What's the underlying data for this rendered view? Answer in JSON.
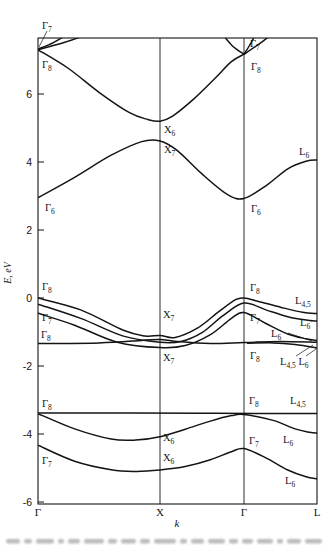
{
  "figure": {
    "background": "#ffffff",
    "line_color": "#141414",
    "cropped_caption_visible": true
  },
  "chart_data": {
    "type": "line",
    "title": "",
    "xlabel": "k",
    "ylabel": "E, eV",
    "legend": "none",
    "grid": "vertical-lines-at-high-symmetry-points",
    "k_points": [
      "Γ",
      "X",
      "Γ",
      "L"
    ],
    "axis": {
      "x_anchors_px": [
        38,
        160,
        244,
        317
      ],
      "y0_px": 298,
      "px_per_ev": 34,
      "top_px": 38,
      "bottom_px": 504,
      "left_px": 38,
      "right_px": 317,
      "y_ticks": [
        6,
        4,
        2,
        0,
        -2,
        -4,
        -6
      ],
      "ylim": [
        -6.1,
        7.65
      ]
    },
    "bands": [
      {
        "name": "conduction-upper",
        "points": [
          [
            0,
            7.3
          ],
          [
            0.25,
            6.75
          ],
          [
            0.5,
            6.05
          ],
          [
            0.75,
            5.45
          ],
          [
            0.9,
            5.25
          ],
          [
            1,
            5.2
          ],
          [
            1.15,
            5.35
          ],
          [
            1.4,
            5.85
          ],
          [
            1.65,
            6.45
          ],
          [
            1.85,
            6.95
          ],
          [
            2,
            7.17
          ]
        ]
      },
      {
        "name": "gamma1-arm-steep",
        "points": [
          [
            0,
            7.32
          ],
          [
            0.13,
            7.52
          ],
          [
            0.26,
            7.8
          ]
        ]
      },
      {
        "name": "gamma1-arm-wide",
        "points": [
          [
            0,
            7.3
          ],
          [
            0.22,
            7.52
          ],
          [
            0.43,
            7.78
          ]
        ]
      },
      {
        "name": "gamma2-arm-left",
        "points": [
          [
            1.73,
            7.8
          ],
          [
            1.86,
            7.42
          ],
          [
            2,
            7.17
          ]
        ]
      },
      {
        "name": "gamma2-arm-right-steep",
        "points": [
          [
            2,
            7.17
          ],
          [
            2.08,
            7.44
          ],
          [
            2.17,
            7.8
          ]
        ]
      },
      {
        "name": "gamma2-arm-right-wide",
        "points": [
          [
            2,
            7.17
          ],
          [
            2.2,
            7.46
          ],
          [
            2.41,
            7.8
          ]
        ]
      },
      {
        "name": "conduction-lower",
        "points": [
          [
            0,
            2.95
          ],
          [
            0.3,
            3.55
          ],
          [
            0.6,
            4.2
          ],
          [
            0.85,
            4.6
          ],
          [
            1,
            4.62
          ],
          [
            1.2,
            4.35
          ],
          [
            1.5,
            3.65
          ],
          [
            1.8,
            3.05
          ],
          [
            2,
            2.93
          ],
          [
            2.3,
            3.3
          ],
          [
            2.6,
            3.8
          ],
          [
            2.85,
            4.02
          ],
          [
            3,
            4.06
          ]
        ]
      },
      {
        "name": "valence-heavy-hole",
        "points": [
          [
            0,
            0
          ],
          [
            0.35,
            -0.35
          ],
          [
            0.7,
            -0.95
          ],
          [
            0.88,
            -1.12
          ],
          [
            1,
            -1.1
          ],
          [
            1.18,
            -1.16
          ],
          [
            1.45,
            -0.88
          ],
          [
            1.7,
            -0.4
          ],
          [
            1.9,
            -0.05
          ],
          [
            2,
            0
          ],
          [
            2.2,
            -0.1
          ],
          [
            2.5,
            -0.27
          ],
          [
            2.8,
            -0.42
          ],
          [
            3,
            -0.46
          ]
        ]
      },
      {
        "name": "valence-light-hole",
        "points": [
          [
            0,
            -0.18
          ],
          [
            0.35,
            -0.6
          ],
          [
            0.7,
            -1.12
          ],
          [
            1,
            -1.3
          ],
          [
            1.25,
            -1.28
          ],
          [
            1.5,
            -1.02
          ],
          [
            1.75,
            -0.52
          ],
          [
            2,
            -0.15
          ],
          [
            2.3,
            -0.35
          ],
          [
            2.6,
            -0.55
          ],
          [
            2.85,
            -0.65
          ],
          [
            3,
            -0.68
          ]
        ]
      },
      {
        "name": "valence-split-off",
        "points": [
          [
            0,
            -0.45
          ],
          [
            0.3,
            -0.8
          ],
          [
            0.65,
            -1.3
          ],
          [
            1,
            -1.46
          ],
          [
            1.3,
            -1.4
          ],
          [
            1.6,
            -1.08
          ],
          [
            1.85,
            -0.6
          ],
          [
            2,
            -0.43
          ],
          [
            2.3,
            -0.75
          ],
          [
            2.6,
            -1.06
          ],
          [
            2.85,
            -1.2
          ],
          [
            3,
            -1.25
          ]
        ]
      },
      {
        "name": "valence-flat",
        "points": [
          [
            0,
            -1.34
          ],
          [
            0.5,
            -1.32
          ],
          [
            0.85,
            -1.25
          ],
          [
            1,
            -1.22
          ],
          [
            1.2,
            -1.28
          ],
          [
            1.6,
            -1.34
          ],
          [
            2,
            -1.31
          ],
          [
            2.5,
            -1.28
          ],
          [
            3,
            -1.3
          ]
        ]
      },
      {
        "name": "valence-flat-L-branch",
        "points": [
          [
            2.05,
            -1.33
          ],
          [
            2.4,
            -1.32
          ],
          [
            2.7,
            -1.37
          ],
          [
            3,
            -1.47
          ]
        ]
      },
      {
        "name": "deep-flat",
        "points": [
          [
            0,
            -3.38
          ],
          [
            1.5,
            -3.39
          ],
          [
            3,
            -3.4
          ]
        ]
      },
      {
        "name": "deep-upper",
        "points": [
          [
            0,
            -3.4
          ],
          [
            0.3,
            -3.85
          ],
          [
            0.6,
            -4.15
          ],
          [
            0.8,
            -4.18
          ],
          [
            1,
            -4.08
          ],
          [
            1.3,
            -3.86
          ],
          [
            1.6,
            -3.62
          ],
          [
            1.85,
            -3.46
          ],
          [
            2,
            -3.43
          ],
          [
            2.4,
            -3.6
          ],
          [
            2.7,
            -3.85
          ],
          [
            2.9,
            -3.95
          ],
          [
            3,
            -3.97
          ]
        ]
      },
      {
        "name": "deep-lower",
        "points": [
          [
            0,
            -4.33
          ],
          [
            0.3,
            -4.8
          ],
          [
            0.6,
            -5.05
          ],
          [
            0.8,
            -5.1
          ],
          [
            1,
            -5.06
          ],
          [
            1.3,
            -4.96
          ],
          [
            1.6,
            -4.76
          ],
          [
            1.85,
            -4.52
          ],
          [
            2,
            -4.43
          ],
          [
            2.3,
            -4.7
          ],
          [
            2.6,
            -5.06
          ],
          [
            2.85,
            -5.26
          ],
          [
            3,
            -5.32
          ]
        ]
      }
    ],
    "point_labels": [
      {
        "x": 42,
        "y": 29,
        "parts": [
          {
            "t": "Γ",
            "sub": "7"
          }
        ]
      },
      {
        "x": 42,
        "y": 68,
        "parts": [
          {
            "t": "Γ",
            "sub": "8"
          }
        ]
      },
      {
        "x": 250,
        "y": 47,
        "parts": [
          {
            "t": "Γ",
            "sub": "7"
          }
        ]
      },
      {
        "x": 251,
        "y": 70,
        "parts": [
          {
            "t": "Γ",
            "sub": "8"
          }
        ]
      },
      {
        "x": 164,
        "y": 133,
        "parts": [
          {
            "t": "X",
            "sub": "6"
          }
        ]
      },
      {
        "x": 164,
        "y": 153,
        "parts": [
          {
            "t": "X",
            "sub": "7"
          }
        ]
      },
      {
        "x": 299,
        "y": 155,
        "parts": [
          {
            "t": "L",
            "sub": "6"
          }
        ]
      },
      {
        "x": 45,
        "y": 211,
        "parts": [
          {
            "t": "Γ",
            "sub": "6"
          }
        ]
      },
      {
        "x": 251,
        "y": 212,
        "parts": [
          {
            "t": "Γ",
            "sub": "6"
          }
        ]
      },
      {
        "x": 42,
        "y": 290,
        "parts": [
          {
            "t": "Γ",
            "sub": "8"
          }
        ]
      },
      {
        "x": 42,
        "y": 321,
        "parts": [
          {
            "t": "Γ",
            "sub": "7"
          }
        ]
      },
      {
        "x": 41,
        "y": 338,
        "parts": [
          {
            "t": "Γ",
            "sub": "8"
          }
        ]
      },
      {
        "x": 163,
        "y": 318,
        "parts": [
          {
            "t": "X",
            "sub": "7"
          }
        ]
      },
      {
        "x": 163,
        "y": 361,
        "parts": [
          {
            "t": "X",
            "sub": "7"
          }
        ]
      },
      {
        "x": 250,
        "y": 291,
        "parts": [
          {
            "t": "Γ",
            "sub": "8"
          }
        ]
      },
      {
        "x": 250,
        "y": 321,
        "parts": [
          {
            "t": "Γ",
            "sub": "7"
          }
        ]
      },
      {
        "x": 250,
        "y": 359,
        "parts": [
          {
            "t": "Γ",
            "sub": "8"
          }
        ]
      },
      {
        "x": 295,
        "y": 304,
        "parts": [
          {
            "t": "L",
            "sub": "4,5"
          }
        ]
      },
      {
        "x": 300,
        "y": 326,
        "parts": [
          {
            "t": "L",
            "sub": "6",
            "post": "′"
          }
        ]
      },
      {
        "x": 271,
        "y": 337,
        "parts": [
          {
            "t": "L",
            "sub": "6"
          }
        ]
      },
      {
        "x": 280,
        "y": 365,
        "parts": [
          {
            "t": "L",
            "sub": "4,5"
          },
          {
            "t": "L",
            "sub": "6"
          }
        ]
      },
      {
        "x": 42,
        "y": 407,
        "parts": [
          {
            "t": "Γ",
            "sub": "8"
          }
        ]
      },
      {
        "x": 42,
        "y": 464,
        "parts": [
          {
            "t": "Γ",
            "sub": "7"
          }
        ]
      },
      {
        "x": 163,
        "y": 441,
        "parts": [
          {
            "t": "X",
            "sub": "6"
          }
        ]
      },
      {
        "x": 163,
        "y": 461,
        "parts": [
          {
            "t": "X",
            "sub": "6"
          }
        ]
      },
      {
        "x": 249,
        "y": 404,
        "parts": [
          {
            "t": "Γ",
            "sub": "8"
          }
        ]
      },
      {
        "x": 249,
        "y": 444,
        "parts": [
          {
            "t": "Γ",
            "sub": "7"
          }
        ]
      },
      {
        "x": 290,
        "y": 404,
        "parts": [
          {
            "t": "L",
            "sub": "4,5"
          }
        ]
      },
      {
        "x": 283,
        "y": 443,
        "parts": [
          {
            "t": "L",
            "sub": "6"
          }
        ]
      },
      {
        "x": 285,
        "y": 484,
        "parts": [
          {
            "t": "L",
            "sub": "6"
          }
        ]
      }
    ],
    "leader_lines": [
      [
        47,
        31,
        39,
        47
      ],
      [
        288,
        333,
        312,
        341
      ],
      [
        296,
        356,
        313,
        345
      ],
      [
        306,
        356,
        316,
        349
      ]
    ]
  }
}
